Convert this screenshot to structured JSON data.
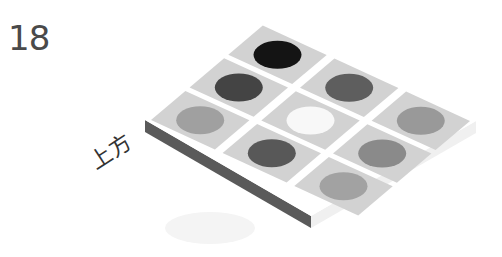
{
  "figure": {
    "number": "18",
    "side_label": "上方"
  },
  "board": {
    "rows": 3,
    "cols": 3,
    "tile_color": "#d2d2d2",
    "gap_color": "#ffffff",
    "edge_color": "#5a5a5a",
    "pieces": [
      {
        "row": 0,
        "col": 0,
        "color": "#141414"
      },
      {
        "row": 0,
        "col": 1,
        "color": "#5e5e5e"
      },
      {
        "row": 0,
        "col": 2,
        "color": "#999999"
      },
      {
        "row": 1,
        "col": 0,
        "color": "#444444"
      },
      {
        "row": 1,
        "col": 1,
        "color": "#f8f8f8"
      },
      {
        "row": 1,
        "col": 2,
        "color": "#8a8a8a"
      },
      {
        "row": 2,
        "col": 0,
        "color": "#a0a0a0"
      },
      {
        "row": 2,
        "col": 1,
        "color": "#585858"
      },
      {
        "row": 2,
        "col": 2,
        "color": "#a2a2a2"
      }
    ]
  }
}
